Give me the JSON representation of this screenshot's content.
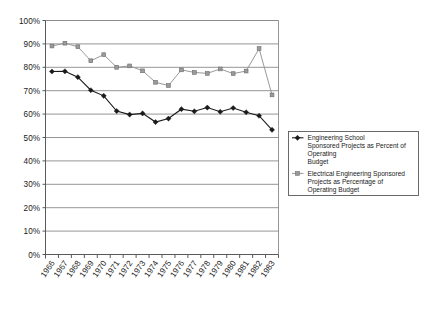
{
  "chart_data": {
    "type": "line",
    "title": "",
    "subtitle": "",
    "xlabel": "",
    "ylabel": "",
    "ylim": [
      0,
      100
    ],
    "ytick_labels": [
      "0%",
      "10%",
      "20%",
      "30%",
      "40%",
      "50%",
      "60%",
      "70%",
      "80%",
      "90%",
      "100%"
    ],
    "ytick_values": [
      0,
      10,
      20,
      30,
      40,
      50,
      60,
      70,
      80,
      90,
      100
    ],
    "grid": "horizontal",
    "legend_position": "right-middle",
    "categories": [
      "1966",
      "1967",
      "1968",
      "1969",
      "1970",
      "1971",
      "1972",
      "1973",
      "1974",
      "1975",
      "1976",
      "1977",
      "1978",
      "1979",
      "1980",
      "1981",
      "1982",
      "1983"
    ],
    "series": [
      {
        "name": "Engineering School Sponsored Projects as Percent of Operating Budget",
        "marker": "diamond",
        "color": "#1a1a1a",
        "values": [
          78.2,
          78.3,
          75.8,
          70.2,
          67.8,
          61.3,
          59.8,
          60.3,
          56.6,
          58.1,
          62.1,
          61.2,
          62.8,
          61.0,
          62.6,
          60.8,
          59.3,
          53.3
        ]
      },
      {
        "name": "Electrical Engineering Sponsored Projects as Percentage of Operating Budget",
        "marker": "square",
        "color": "#9a9a9a",
        "values": [
          89.1,
          90.3,
          88.8,
          82.8,
          85.4,
          80.0,
          80.6,
          78.5,
          73.6,
          72.2,
          78.9,
          77.8,
          77.4,
          79.3,
          77.3,
          78.4,
          88.0,
          68.2
        ]
      }
    ]
  },
  "legend": {
    "entries": [
      {
        "marker_name": "diamond-marker",
        "lines": [
          "Engineering School",
          "Sponsored Projects as Percent of",
          "Operating",
          "Budget"
        ]
      },
      {
        "marker_name": "square-marker",
        "lines": [
          "Electrical Engineering Sponsored",
          "Projects as Percentage of",
          "Operating Budget"
        ]
      }
    ]
  },
  "colors": {
    "series_a": "#1a1a1a",
    "series_b": "#9a9a9a",
    "grid": "#8a8a8a",
    "axis": "#5a5a5a",
    "background": "#ffffff"
  }
}
